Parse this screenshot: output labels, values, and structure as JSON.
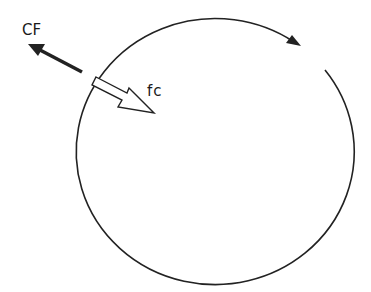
{
  "diagram": {
    "labels": {
      "centrifugal": "CF",
      "centripetal": "fc"
    },
    "icons": {
      "motion_direction": "clockwise-arrow-icon",
      "centrifugal_force": "solid-arrow-outward-icon",
      "centripetal_force": "hollow-arrow-inward-icon"
    },
    "colors": {
      "stroke": "#222222",
      "background": "#ffffff"
    }
  }
}
